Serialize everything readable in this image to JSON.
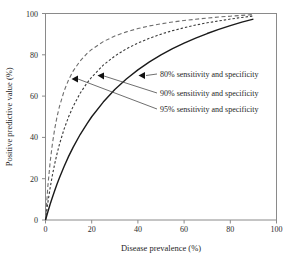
{
  "chart_data": {
    "type": "line",
    "title": "",
    "xlabel": "Disease prevalence (%)",
    "ylabel": "Positive predictive value (%)",
    "xlim": [
      0,
      100
    ],
    "ylim": [
      0,
      100
    ],
    "xticks": [
      0,
      20,
      40,
      60,
      80,
      100
    ],
    "yticks": [
      0,
      20,
      40,
      60,
      80,
      100
    ],
    "xtick_labels": [
      "0",
      "20",
      "40",
      "60",
      "80",
      "100"
    ],
    "ytick_labels": [
      "0",
      "20",
      "40",
      "60",
      "80",
      "100"
    ],
    "grid": false,
    "legend_position": "inside-right-annotations",
    "x": [
      0,
      1,
      2,
      3,
      4,
      5,
      6,
      8,
      10,
      12,
      15,
      18,
      20,
      25,
      30,
      35,
      40,
      45,
      50,
      55,
      60,
      65,
      70,
      75,
      80,
      85,
      90
    ],
    "series": [
      {
        "name": "80% sensitivity and specificity",
        "linestyle": "solid",
        "color": "#1a1a1a",
        "values": [
          0,
          3.9,
          7.6,
          11.0,
          14.3,
          17.4,
          20.3,
          25.8,
          30.8,
          35.3,
          41.4,
          46.7,
          50.0,
          57.1,
          63.2,
          68.3,
          72.7,
          76.6,
          80.0,
          83.0,
          85.7,
          88.1,
          90.3,
          92.3,
          94.1,
          95.8,
          97.3
        ]
      },
      {
        "name": "90% sensitivity and specificity",
        "linestyle": "dotted",
        "color": "#3a3a3a",
        "values": [
          0,
          8.3,
          15.5,
          21.8,
          27.3,
          32.1,
          36.5,
          43.9,
          50.0,
          55.1,
          61.4,
          66.4,
          69.2,
          75.0,
          79.4,
          82.9,
          85.7,
          88.0,
          90.0,
          91.7,
          93.1,
          94.4,
          95.5,
          96.4,
          97.3,
          98.1,
          98.8
        ]
      },
      {
        "name": "95% sensitivity and specificity",
        "linestyle": "dashed",
        "color": "#6e6e6e",
        "values": [
          0,
          16.1,
          27.9,
          37.0,
          44.2,
          50.0,
          54.8,
          62.3,
          67.9,
          72.2,
          77.0,
          80.7,
          82.6,
          86.4,
          89.1,
          91.1,
          92.7,
          94.0,
          95.0,
          95.9,
          96.6,
          97.2,
          97.8,
          98.3,
          98.7,
          99.1,
          99.5
        ]
      }
    ],
    "annotations": [
      {
        "text": "80% sensitivity and specificity",
        "arrow_tip_x": 44.5,
        "arrow_tip_y": 72.0,
        "label_x": 50.0,
        "label_y": 70.0
      },
      {
        "text": "90% sensitivity and specificity",
        "arrow_tip_x": 25.5,
        "arrow_tip_y": 73.5,
        "label_x": 50.0,
        "label_y": 61.0
      },
      {
        "text": "95% sensitivity and specificity",
        "arrow_tip_x": 15.0,
        "arrow_tip_y": 69.5,
        "label_x": 50.0,
        "label_y": 53.0
      }
    ]
  },
  "axes": {
    "x_title": "Disease prevalence (%)",
    "y_title": "Positive predictive value (%)",
    "x_tick_0": "0",
    "x_tick_1": "20",
    "x_tick_2": "40",
    "x_tick_3": "60",
    "x_tick_4": "80",
    "x_tick_5": "100",
    "y_tick_0": "0",
    "y_tick_1": "20",
    "y_tick_2": "40",
    "y_tick_3": "60",
    "y_tick_4": "80",
    "y_tick_5": "100"
  },
  "annotations_text": {
    "label_80": "80% sensitivity and specificity",
    "label_90": "90% sensitivity and specificity",
    "label_95": "95% sensitivity and specificity"
  },
  "colors": {
    "curve_80": "#1a1a1a",
    "curve_90": "#3a3a3a",
    "curve_95": "#6e6e6e",
    "frame": "#8a8a8a",
    "text": "#1f1f1f",
    "background": "#ffffff"
  }
}
